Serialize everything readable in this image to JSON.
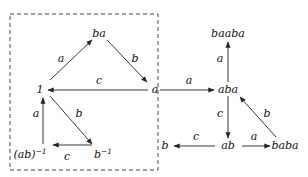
{
  "diagram": {
    "title": "",
    "nodes": [
      {
        "id": "one",
        "label": "1"
      },
      {
        "id": "ba",
        "label": "ba"
      },
      {
        "id": "a",
        "label": "a"
      },
      {
        "id": "abinv",
        "label": "(ab)",
        "sup": "−1"
      },
      {
        "id": "binv",
        "label": "b",
        "sup": "−1"
      },
      {
        "id": "baaba",
        "label": "baaba"
      },
      {
        "id": "aba",
        "label": "aba"
      },
      {
        "id": "ab",
        "label": "ab"
      },
      {
        "id": "b",
        "label": "b"
      },
      {
        "id": "baba",
        "label": "baba"
      }
    ],
    "edges": [
      {
        "from": "one",
        "to": "ba",
        "label": "a"
      },
      {
        "from": "ba",
        "to": "a",
        "label": "b"
      },
      {
        "from": "a",
        "to": "one",
        "label": "c"
      },
      {
        "from": "one",
        "to": "binv",
        "label": "b"
      },
      {
        "from": "binv",
        "to": "abinv",
        "label": "c"
      },
      {
        "from": "abinv",
        "to": "one",
        "label": "a"
      },
      {
        "from": "a",
        "to": "aba",
        "label": "a"
      },
      {
        "from": "aba",
        "to": "baaba",
        "label": "a"
      },
      {
        "from": "aba",
        "to": "ab",
        "label": "c"
      },
      {
        "from": "ab",
        "to": "b",
        "label": "c"
      },
      {
        "from": "ab",
        "to": "baba",
        "label": "a"
      },
      {
        "from": "baba",
        "to": "aba",
        "label": "b"
      }
    ],
    "grouping": {
      "style": "dashed-box",
      "contains": [
        "one",
        "ba",
        "a",
        "abinv",
        "binv"
      ]
    }
  }
}
